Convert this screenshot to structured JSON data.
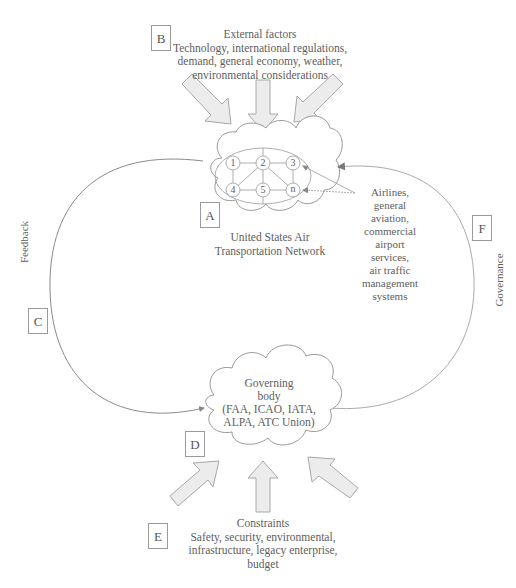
{
  "diagram": {
    "external_factors": {
      "label": "B",
      "title": "External factors",
      "lines": [
        "Technology, international regulations,",
        "demand, general economy, weather,",
        "environmental considerations"
      ]
    },
    "network": {
      "label": "A",
      "nodes": [
        "1",
        "2",
        "3",
        "4",
        "5",
        "n"
      ],
      "caption_lines": [
        "United States Air",
        "Transportation Network"
      ]
    },
    "participants": {
      "lines": [
        "Airlines,",
        "general",
        "aviation,",
        "commercial",
        "airport",
        "services,",
        "air traffic",
        "management",
        "systems"
      ]
    },
    "feedback": {
      "label": "C",
      "text": "Feedback"
    },
    "governance": {
      "label": "F",
      "text": "Governance"
    },
    "governing_body": {
      "label": "D",
      "lines": [
        "Governing",
        "body",
        "(FAA, ICAO, IATA,",
        "ALPA, ATC Union)"
      ]
    },
    "constraints": {
      "label": "E",
      "title": "Constraints",
      "lines": [
        "Safety, security, environmental,",
        "infrastructure, legacy enterprise,",
        "budget"
      ]
    },
    "colors": {
      "line": "#8a8a8a",
      "arrow_fill": "#ececec",
      "arrow_stroke": "#a8a8a8",
      "text": "#5e5e5e"
    }
  }
}
